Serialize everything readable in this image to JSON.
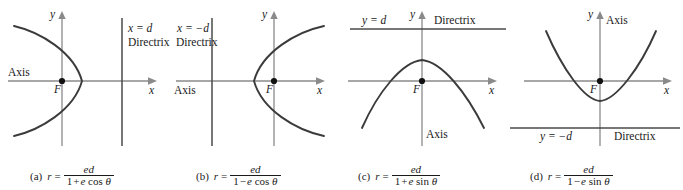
{
  "figure": {
    "colors": {
      "axis": "#8a8a8a",
      "curve": "#3b3b3b",
      "directrix": "#4a4a4a",
      "text": "#1a1a1a",
      "background": "#ffffff"
    }
  },
  "panels": [
    {
      "tag": "(a)",
      "x_axis_label": "x",
      "y_axis_label": "y",
      "focus_label": "F",
      "axis_label": "Axis",
      "directrix_value": "x = d",
      "directrix_word": "Directrix",
      "equation": {
        "lhs": "r",
        "eq": "=",
        "numerator": "ed",
        "denominator": {
          "one": "1",
          "op": "+",
          "e": "e",
          "fn": "cos",
          "theta": "θ"
        }
      },
      "curve_type": "parabola-opening-left"
    },
    {
      "tag": "(b)",
      "x_axis_label": "x",
      "y_axis_label": "y",
      "focus_label": "F",
      "axis_label": "Axis",
      "directrix_value": "x = −d",
      "directrix_word": "Directrix",
      "equation": {
        "lhs": "r",
        "eq": "=",
        "numerator": "ed",
        "denominator": {
          "one": "1",
          "op": "−",
          "e": "e",
          "fn": "cos",
          "theta": "θ"
        }
      },
      "curve_type": "parabola-opening-right"
    },
    {
      "tag": "(c)",
      "x_axis_label": "x",
      "y_axis_label": "y",
      "focus_label": "F",
      "axis_label": "Axis",
      "directrix_value": "y = d",
      "directrix_word": "Directrix",
      "equation": {
        "lhs": "r",
        "eq": "=",
        "numerator": "ed",
        "denominator": {
          "one": "1",
          "op": "+",
          "e": "e",
          "fn": "sin",
          "theta": "θ"
        }
      },
      "curve_type": "parabola-opening-down"
    },
    {
      "tag": "(d)",
      "x_axis_label": "x",
      "y_axis_label": "y",
      "focus_label": "F",
      "axis_label": "Axis",
      "directrix_value": "y = −d",
      "directrix_word": "Directrix",
      "equation": {
        "lhs": "r",
        "eq": "=",
        "numerator": "ed",
        "denominator": {
          "one": "1",
          "op": "−",
          "e": "e",
          "fn": "sin",
          "theta": "θ"
        }
      },
      "curve_type": "parabola-opening-up"
    }
  ]
}
